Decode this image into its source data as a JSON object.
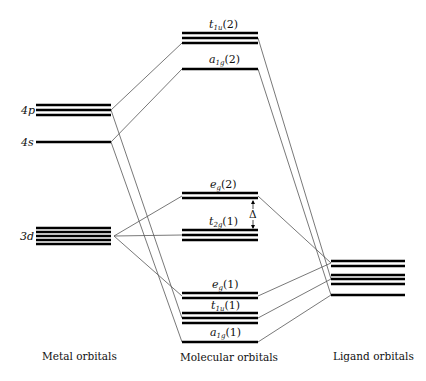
{
  "diagram": {
    "type": "molecular-orbital energy diagram",
    "columns": [
      {
        "id": "metal",
        "label": "Metal orbitals"
      },
      {
        "id": "molecular",
        "label": "Molecular orbitals"
      },
      {
        "id": "ligand",
        "label": "Ligand orbitals"
      }
    ],
    "metal_levels": [
      {
        "id": "4p",
        "label": "4p",
        "degeneracy": 3
      },
      {
        "id": "4s",
        "label": "4s",
        "degeneracy": 1
      },
      {
        "id": "3d",
        "label": "3d",
        "degeneracy": 5
      }
    ],
    "molecular_levels": [
      {
        "id": "t1u2",
        "sym": "t",
        "sub": "1u",
        "paren": "(2)",
        "degeneracy": 3
      },
      {
        "id": "a1g2",
        "sym": "a",
        "sub": "1g",
        "paren": "(2)",
        "degeneracy": 1
      },
      {
        "id": "eg2",
        "sym": "e",
        "sub": "g",
        "paren": "(2)",
        "degeneracy": 2
      },
      {
        "id": "t2g1",
        "sym": "t",
        "sub": "2g",
        "paren": "(1)",
        "degeneracy": 3
      },
      {
        "id": "eg1",
        "sym": "e",
        "sub": "g",
        "paren": "(1)",
        "degeneracy": 2
      },
      {
        "id": "t1u1",
        "sym": "t",
        "sub": "1u",
        "paren": "(1)",
        "degeneracy": 3
      },
      {
        "id": "a1g1",
        "sym": "a",
        "sub": "1g",
        "paren": "(1)",
        "degeneracy": 1
      }
    ],
    "ligand_levels": [
      {
        "id": "L_eg",
        "degeneracy": 2
      },
      {
        "id": "L_t1u",
        "degeneracy": 3
      },
      {
        "id": "L_a1g",
        "degeneracy": 1
      }
    ],
    "splitting_label": "Δ"
  }
}
